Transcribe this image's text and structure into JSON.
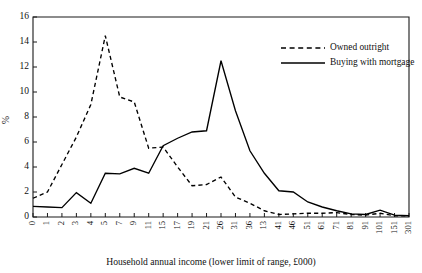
{
  "chart_data": {
    "type": "line",
    "title": "",
    "subtitle": "",
    "xlabel": "Household annual income (lower limit of range, £000)",
    "ylabel": "%",
    "grid": false,
    "legend_position": "top-right",
    "ylim": [
      0,
      16
    ],
    "yticks": [
      0,
      2,
      4,
      6,
      8,
      10,
      12,
      14,
      16
    ],
    "categories": [
      "0",
      "1",
      "2",
      "3",
      "4",
      "5",
      "7",
      "9",
      "11",
      "15",
      "17",
      "19",
      "21",
      "26",
      "31",
      "36",
      "13",
      "41",
      "46",
      "51",
      "61",
      "71",
      "81",
      "91",
      "101",
      "151",
      "301"
    ],
    "series": [
      {
        "name": "Owned outright",
        "style": "dashed",
        "color": "#000000",
        "values": [
          1.5,
          2.0,
          4.2,
          6.4,
          9.0,
          14.5,
          9.6,
          9.2,
          5.5,
          5.6,
          4.0,
          2.5,
          2.6,
          3.2,
          1.6,
          1.1,
          0.5,
          0.2,
          0.25,
          0.3,
          0.3,
          0.35,
          0.2,
          0.15,
          0.3,
          0.1,
          0.1
        ]
      },
      {
        "name": "Buying with mortgage",
        "style": "solid",
        "color": "#000000",
        "values": [
          0.85,
          0.8,
          0.75,
          1.95,
          1.1,
          3.5,
          3.45,
          3.9,
          3.5,
          5.7,
          6.3,
          6.8,
          6.9,
          12.5,
          8.5,
          5.3,
          3.5,
          2.1,
          2.0,
          1.2,
          0.8,
          0.5,
          0.25,
          0.2,
          0.55,
          0.15,
          0.1
        ]
      }
    ],
    "legend": [
      {
        "label": "Owned outright",
        "style": "dashed"
      },
      {
        "label": "Buying with mortgage",
        "style": "solid"
      }
    ]
  }
}
